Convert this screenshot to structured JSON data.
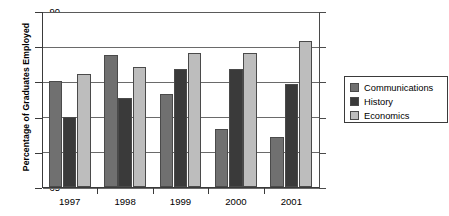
{
  "chart_data": {
    "type": "bar",
    "title": "",
    "xlabel": "",
    "ylabel": "Percentage of Graduates Employed",
    "categories": [
      "1997",
      "1998",
      "1999",
      "2000",
      "2001"
    ],
    "series": [
      {
        "name": "Communications",
        "color": "#707070",
        "values": [
          80.0,
          83.8,
          78.2,
          73.3,
          72.1
        ]
      },
      {
        "name": "History",
        "color": "#3a3a3a",
        "values": [
          75.0,
          77.7,
          81.8,
          81.7,
          79.7
        ]
      },
      {
        "name": "Economics",
        "color": "#bdbdbd",
        "values": [
          81.0,
          82.1,
          84.0,
          84.0,
          85.7
        ]
      }
    ],
    "ylim": [
      65,
      90
    ],
    "yticks": [
      65,
      70,
      75,
      80,
      85,
      90
    ],
    "ytick_labels": [
      "65",
      "70",
      "75",
      "80",
      "85",
      "90"
    ],
    "grid": true,
    "legend_position": "right"
  },
  "legend": {
    "entries": [
      {
        "label": "Communications"
      },
      {
        "label": "History"
      },
      {
        "label": "Economics"
      }
    ]
  }
}
